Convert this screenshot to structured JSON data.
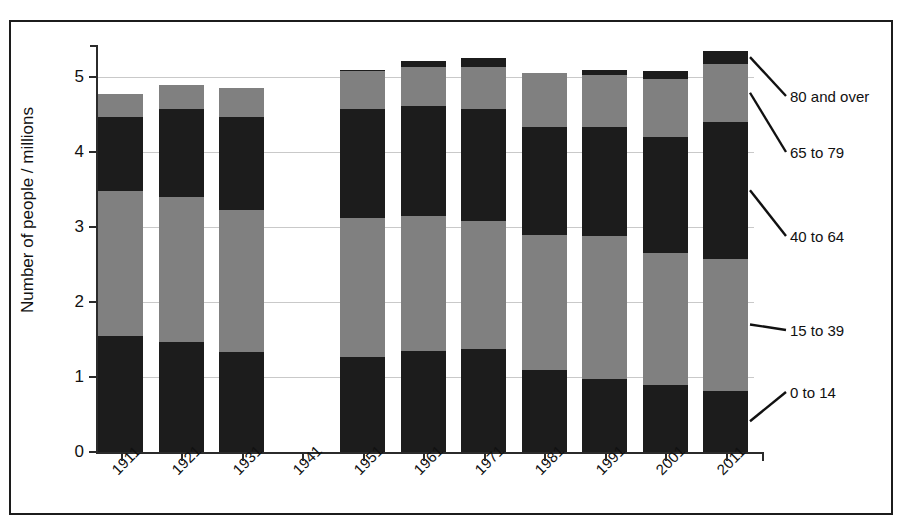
{
  "chart_data": {
    "type": "bar",
    "stacked": true,
    "title": "",
    "subtitle": "",
    "xlabel": "",
    "ylabel": "Number of people / millions",
    "categories": [
      "1911",
      "1921",
      "1931",
      "1941",
      "1951",
      "1961",
      "1971",
      "1981",
      "1991",
      "2001",
      "2011"
    ],
    "ylim": [
      0,
      5.6
    ],
    "yticks": [
      "0",
      "1",
      "2",
      "3",
      "4",
      "5"
    ],
    "ytick_values": [
      0,
      1,
      2,
      3,
      4,
      5
    ],
    "grid": true,
    "legend_position": "right-leader-lines",
    "note_missing_category": "1941",
    "series": [
      {
        "name": "0 to 14",
        "color": "#1c1c1c",
        "values": [
          1.55,
          1.47,
          1.33,
          0,
          1.27,
          1.35,
          1.37,
          1.1,
          0.98,
          0.9,
          0.82
        ]
      },
      {
        "name": "15 to 39",
        "color": "#808080",
        "values": [
          1.93,
          1.93,
          1.9,
          0,
          1.85,
          1.8,
          1.71,
          1.8,
          1.9,
          1.75,
          1.76
        ]
      },
      {
        "name": "40 to 64",
        "color": "#1c1c1c",
        "values": [
          0.99,
          1.18,
          1.24,
          0,
          1.45,
          1.47,
          1.5,
          1.43,
          1.45,
          1.55,
          1.82
        ]
      },
      {
        "name": "65 to 79",
        "color": "#808080",
        "values": [
          0.31,
          0.31,
          0.38,
          0,
          0.51,
          0.52,
          0.56,
          0.72,
          0.7,
          0.78,
          0.78
        ]
      },
      {
        "name": "80 and over",
        "color": "#1c1c1c",
        "values": [
          0.0,
          0.0,
          0.0,
          0,
          0.02,
          0.07,
          0.11,
          0.0,
          0.07,
          0.1,
          0.17
        ]
      }
    ],
    "totals": [
      4.78,
      4.89,
      4.85,
      0,
      5.1,
      5.21,
      5.25,
      5.05,
      5.1,
      5.08,
      5.35
    ]
  },
  "axis": {
    "y_title": "Number of people / millions"
  },
  "legend": {
    "labels": [
      {
        "text": "80 and over"
      },
      {
        "text": "65 to 79"
      },
      {
        "text": "40 to 64"
      },
      {
        "text": "15 to 39"
      },
      {
        "text": "0 to 14"
      }
    ]
  }
}
